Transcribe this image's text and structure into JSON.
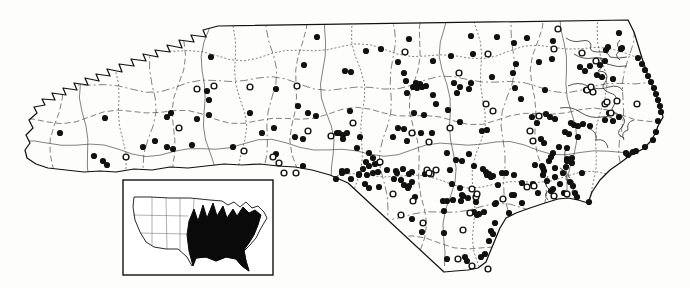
{
  "figure": {
    "kind": "species distribution dot map with US range inset",
    "canvas": {
      "width": 690,
      "height": 288
    }
  },
  "colors": {
    "paper": "#fdfdfb",
    "ink": "#111111",
    "county_line": "#3a3a3a",
    "water_line": "#2c2c2c",
    "range_fill": "#0a0a0a"
  },
  "markers": {
    "filled_radius": 3.1,
    "open_radius": 2.9,
    "open_stroke_width": 1.4,
    "filled_points": [
      [
        105,
        118
      ],
      [
        60,
        133
      ],
      [
        94,
        156
      ],
      [
        103,
        161
      ],
      [
        107,
        165
      ],
      [
        143,
        147
      ],
      [
        155,
        141
      ],
      [
        167,
        117
      ],
      [
        171,
        113
      ],
      [
        197,
        119
      ],
      [
        209,
        115
      ],
      [
        209,
        100
      ],
      [
        207,
        91
      ],
      [
        211,
        57
      ],
      [
        250,
        113
      ],
      [
        274,
        128
      ],
      [
        276,
        89
      ],
      [
        304,
        65
      ],
      [
        298,
        106
      ],
      [
        308,
        113
      ],
      [
        316,
        116
      ],
      [
        317,
        37
      ],
      [
        345,
        71
      ],
      [
        351,
        72
      ],
      [
        167,
        147
      ],
      [
        173,
        149
      ],
      [
        192,
        145
      ],
      [
        233,
        147
      ],
      [
        262,
        133
      ],
      [
        276,
        154
      ],
      [
        295,
        137
      ],
      [
        303,
        139
      ],
      [
        303,
        166
      ],
      [
        336,
        179
      ],
      [
        337,
        133
      ],
      [
        343,
        135
      ],
      [
        342,
        173
      ],
      [
        347,
        171
      ],
      [
        357,
        148
      ],
      [
        359,
        175
      ],
      [
        366,
        51
      ],
      [
        381,
        49
      ],
      [
        409,
        39
      ],
      [
        471,
        36
      ],
      [
        497,
        37
      ],
      [
        514,
        43
      ],
      [
        527,
        38
      ],
      [
        553,
        41
      ],
      [
        619,
        33
      ],
      [
        608,
        47
      ],
      [
        622,
        48
      ],
      [
        398,
        62
      ],
      [
        433,
        61
      ],
      [
        473,
        54
      ],
      [
        451,
        56
      ],
      [
        516,
        64
      ],
      [
        539,
        62
      ],
      [
        552,
        59
      ],
      [
        404,
        73
      ],
      [
        406,
        81
      ],
      [
        492,
        77
      ],
      [
        471,
        83
      ],
      [
        416,
        83
      ],
      [
        420,
        84
      ],
      [
        413,
        87
      ],
      [
        417,
        88
      ],
      [
        422,
        87
      ],
      [
        426,
        86
      ],
      [
        454,
        83
      ],
      [
        460,
        87
      ],
      [
        469,
        89
      ],
      [
        407,
        93
      ],
      [
        433,
        95
      ],
      [
        457,
        93
      ],
      [
        436,
        104
      ],
      [
        448,
        110
      ],
      [
        424,
        115
      ],
      [
        414,
        113
      ],
      [
        404,
        129
      ],
      [
        398,
        128
      ],
      [
        350,
        111
      ],
      [
        339,
        133
      ],
      [
        347,
        133
      ],
      [
        343,
        139
      ],
      [
        360,
        137
      ],
      [
        393,
        137
      ],
      [
        407,
        141
      ],
      [
        421,
        133
      ],
      [
        432,
        133
      ],
      [
        460,
        122
      ],
      [
        482,
        131
      ],
      [
        487,
        130
      ],
      [
        369,
        153
      ],
      [
        373,
        158
      ],
      [
        366,
        162
      ],
      [
        369,
        166
      ],
      [
        375,
        164
      ],
      [
        379,
        163
      ],
      [
        363,
        169
      ],
      [
        359,
        174
      ],
      [
        367,
        175
      ],
      [
        373,
        173
      ],
      [
        378,
        172
      ],
      [
        342,
        171
      ],
      [
        351,
        179
      ],
      [
        365,
        184
      ],
      [
        369,
        188
      ],
      [
        379,
        187
      ],
      [
        387,
        170
      ],
      [
        396,
        171
      ],
      [
        403,
        169
      ],
      [
        394,
        179
      ],
      [
        401,
        180
      ],
      [
        409,
        174
      ],
      [
        412,
        182
      ],
      [
        447,
        153
      ],
      [
        456,
        160
      ],
      [
        462,
        161
      ],
      [
        450,
        170
      ],
      [
        469,
        154
      ],
      [
        483,
        169
      ],
      [
        487,
        175
      ],
      [
        491,
        177
      ],
      [
        408,
        188
      ],
      [
        415,
        197
      ],
      [
        443,
        201
      ],
      [
        447,
        201
      ],
      [
        453,
        200
      ],
      [
        463,
        196
      ],
      [
        468,
        198
      ],
      [
        513,
        73
      ],
      [
        515,
        88
      ],
      [
        521,
        99
      ],
      [
        545,
        90
      ],
      [
        546,
        114
      ],
      [
        532,
        117
      ],
      [
        537,
        123
      ],
      [
        550,
        117
      ],
      [
        555,
        119
      ],
      [
        541,
        139
      ],
      [
        544,
        143
      ],
      [
        571,
        123
      ],
      [
        574,
        125
      ],
      [
        578,
        126
      ],
      [
        583,
        124
      ],
      [
        590,
        126
      ],
      [
        565,
        132
      ],
      [
        569,
        134
      ],
      [
        578,
        137
      ],
      [
        559,
        147
      ],
      [
        567,
        148
      ],
      [
        572,
        158
      ],
      [
        567,
        159
      ],
      [
        551,
        157
      ],
      [
        542,
        166
      ],
      [
        555,
        168
      ],
      [
        566,
        167
      ],
      [
        605,
        120
      ],
      [
        609,
        113
      ],
      [
        613,
        121
      ],
      [
        619,
        117
      ],
      [
        590,
        89
      ],
      [
        580,
        67
      ],
      [
        590,
        66
      ],
      [
        600,
        65
      ],
      [
        606,
        50
      ],
      [
        621,
        49
      ],
      [
        605,
        61
      ],
      [
        585,
        71
      ],
      [
        586,
        90
      ],
      [
        597,
        75
      ],
      [
        602,
        77
      ],
      [
        613,
        79
      ],
      [
        638,
        58
      ],
      [
        642,
        64
      ],
      [
        645,
        70
      ],
      [
        648,
        76
      ],
      [
        651,
        82
      ],
      [
        654,
        88
      ],
      [
        656,
        94
      ],
      [
        658,
        100
      ],
      [
        660,
        106
      ],
      [
        661,
        112
      ],
      [
        658,
        121
      ],
      [
        656,
        132
      ],
      [
        653,
        140
      ],
      [
        645,
        147
      ],
      [
        636,
        151
      ],
      [
        628,
        155
      ],
      [
        626,
        153
      ],
      [
        633,
        152
      ],
      [
        397,
        173
      ],
      [
        412,
        172
      ],
      [
        425,
        174
      ],
      [
        404,
        185
      ],
      [
        409,
        186
      ],
      [
        452,
        184
      ],
      [
        460,
        188
      ],
      [
        462,
        195
      ],
      [
        444,
        211
      ],
      [
        461,
        201
      ],
      [
        476,
        202
      ],
      [
        486,
        172
      ],
      [
        489,
        174
      ],
      [
        493,
        176
      ],
      [
        498,
        185
      ],
      [
        506,
        173
      ],
      [
        514,
        175
      ],
      [
        522,
        183
      ],
      [
        514,
        195
      ],
      [
        496,
        203
      ],
      [
        484,
        212
      ],
      [
        477,
        215
      ],
      [
        495,
        223
      ],
      [
        491,
        231
      ],
      [
        493,
        234
      ],
      [
        489,
        241
      ],
      [
        485,
        254
      ],
      [
        481,
        257
      ],
      [
        412,
        219
      ],
      [
        422,
        232
      ],
      [
        444,
        233
      ],
      [
        447,
        259
      ],
      [
        465,
        257
      ],
      [
        467,
        261
      ],
      [
        533,
        184
      ],
      [
        553,
        189
      ],
      [
        564,
        193
      ],
      [
        509,
        213
      ],
      [
        522,
        203
      ],
      [
        553,
        153
      ],
      [
        549,
        161
      ],
      [
        543,
        168
      ],
      [
        543,
        175
      ],
      [
        555,
        177
      ],
      [
        563,
        173
      ],
      [
        567,
        161
      ],
      [
        572,
        163
      ],
      [
        570,
        182
      ],
      [
        573,
        186
      ],
      [
        560,
        184
      ],
      [
        575,
        193
      ],
      [
        577,
        197
      ],
      [
        589,
        202
      ],
      [
        582,
        173
      ],
      [
        474,
        166
      ],
      [
        502,
        173
      ],
      [
        535,
        165
      ],
      [
        544,
        171
      ],
      [
        547,
        181
      ],
      [
        512,
        195
      ],
      [
        538,
        193
      ],
      [
        551,
        191
      ],
      [
        495,
        204
      ],
      [
        474,
        212
      ],
      [
        479,
        214
      ]
    ],
    "open_points": [
      [
        126,
        157
      ],
      [
        179,
        128
      ],
      [
        197,
        89
      ],
      [
        214,
        86
      ],
      [
        250,
        87
      ],
      [
        297,
        86
      ],
      [
        244,
        151
      ],
      [
        273,
        157
      ],
      [
        279,
        163
      ],
      [
        284,
        173
      ],
      [
        296,
        173
      ],
      [
        308,
        131
      ],
      [
        331,
        136
      ],
      [
        353,
        123
      ],
      [
        412,
        133
      ],
      [
        429,
        142
      ],
      [
        450,
        128
      ],
      [
        486,
        104
      ],
      [
        493,
        111
      ],
      [
        380,
        162
      ],
      [
        427,
        170
      ],
      [
        431,
        174
      ],
      [
        436,
        170
      ],
      [
        476,
        197
      ],
      [
        503,
        199
      ],
      [
        405,
        52
      ],
      [
        488,
        54
      ],
      [
        459,
        73
      ],
      [
        558,
        29
      ],
      [
        554,
        49
      ],
      [
        582,
        53
      ],
      [
        539,
        116
      ],
      [
        530,
        131
      ],
      [
        533,
        141
      ],
      [
        587,
        90
      ],
      [
        593,
        92
      ],
      [
        605,
        104
      ],
      [
        611,
        113
      ],
      [
        637,
        104
      ],
      [
        596,
        61
      ],
      [
        591,
        87
      ],
      [
        607,
        102
      ],
      [
        617,
        101
      ],
      [
        393,
        194
      ],
      [
        413,
        201
      ],
      [
        401,
        215
      ],
      [
        423,
        223
      ],
      [
        477,
        194
      ],
      [
        470,
        213
      ],
      [
        463,
        230
      ],
      [
        458,
        259
      ],
      [
        472,
        266
      ],
      [
        488,
        269
      ],
      [
        534,
        186
      ],
      [
        567,
        194
      ],
      [
        429,
        173
      ],
      [
        554,
        196
      ],
      [
        527,
        187
      ],
      [
        472,
        189
      ]
    ]
  },
  "geometry": {
    "state_outline": "M218,26 L628,20 L634,32 L638,45 L642,58 L646,70 L650,80 L654,90 L658,100 L661,110 L663,117 L658,126 L655,134 L650,142 L643,149 L635,153 L628,157 L620,163 L610,170 L600,180 L592,192 L588,203 L578,200 L568,198 L558,199 L545,203 L530,208 L516,213 L506,218 L500,228 L495,240 L490,252 L486,262 L478,268 L468,270 L455,271 L444,272 L348,183 L330,175 L312,170 L295,167 L278,166 L260,164 L242,165 L224,164 L206,166 L188,168 L170,167 L152,170 L134,169 L116,172 L100,171 L84,172 L66,170 L48,168 L36,164 L27,158 L25,150 L30,143 L26,135 L33,128 L29,120 L37,113 L34,107 L45,105 L42,99 L55,100 L52,93 L66,95 L63,88 L77,90 L74,83 L88,85 L85,78 L99,81 L96,74 L110,76 L107,69 L122,72 L119,64 L134,66 L131,59 L146,61 L143,54 L158,57 L155,50 L170,52 L167,45 L182,48 L179,40 L194,42 L191,35 L206,37 L203,30 Z",
    "county_grid": {
      "vertical_x": [
        58,
        88,
        118,
        148,
        178,
        208,
        238,
        268,
        298,
        328,
        358,
        388,
        418,
        448,
        478,
        508,
        538,
        568,
        598,
        626
      ],
      "horizontal_y": [
        52,
        84,
        116,
        148,
        180,
        212,
        244
      ],
      "amplitude": 6,
      "dash_patterns": [
        "6,3",
        "",
        "2,2",
        "8,3,2,3"
      ]
    },
    "water_lines": [
      "M566,38 q7,5 15,3 q9,-2 10,4 q-3,7 7,7 q10,-1 12,5 q9,2 17,0",
      "M574,54 q9,6 19,4 q12,-2 14,6 q11,4 20,2",
      "M600,58 q6,8 -2,13 q12,0 8,10 q-8,8 4,12 q10,2 4,12 q-6,8 6,10 q8,4 2,12 q-8,7 2,11",
      "M568,86 q10,-5 20,0 q10,5 21,1 q10,-3 14,4",
      "M560,108 q12,-2 20,4 q10,7 22,5 q8,-2 12,3",
      "M588,128 q10,4 8,12 q10,-2 12,8",
      "M560,168 q8,4 6,12 q10,-2 8,8 q-6,8 6,8",
      "M548,176 q-6,8 2,14 q-8,4 -2,10",
      "M566,148 q-4,10 4,16 q-8,6 0,14",
      "M620,40 q-6,6 2,10 q-10,4 -2,10",
      "M634,120 q-8,2 -6,10 q-8,2 -4,10"
    ],
    "inset": {
      "frame": [
        123,
        180,
        150,
        95
      ],
      "origin": [
        128,
        185
      ],
      "us_outline": "M6,12 L22,12 L42,13 L62,13 L82,15 L94,16 L100,20 L106,17 L112,22 L118,17 L124,23 L130,21 L136,27 L139,33 L133,43 L128,53 L122,60 L116,66 L118,76 L121,86 L114,81 L108,74 L98,72 L88,76 L78,72 L68,73 L64,81 L59,72 L50,64 L38,64 L26,62 L18,57 L12,47 L7,35 L5,22 Z",
      "range_fill": "M65,81 L61,66 L59,50 L61,36 L66,24 L70,36 L75,20 L79,33 L85,18 L89,31 L95,21 L99,33 L105,24 L109,31 L115,22 L121,28 L127,25 L133,30 L130,40 L126,50 L121,58 L116,65 L118,76 L121,86 L114,81 L108,74 L98,72 L88,76 L78,72 L68,73 Z",
      "state_lines": [
        "M24,12 L24,60",
        "M38,13 L39,64",
        "M52,13 L52,66",
        "M5,30 L60,31",
        "M12,48 L59,49",
        "M66,14 L64,50"
      ]
    }
  }
}
